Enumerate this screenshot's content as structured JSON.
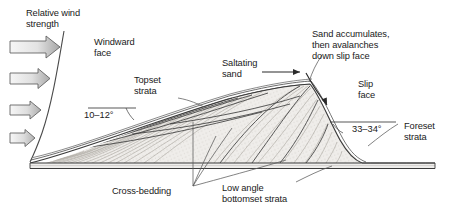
{
  "figure": {
    "type": "geological-cross-section-diagram",
    "background_color": "#ffffff",
    "outline_color": "#3a3a3a",
    "sand_fill_color": "#eceae6",
    "text_color": "#1a1a1a"
  },
  "labels": {
    "relative_wind_strength": "Relative wind\nstrength",
    "windward_face": "Windward\nface",
    "topset_strata": "Topset\nstrata",
    "saltating_sand": "Saltating\nsand",
    "sand_accumulates": "Sand accumulates,\nthen avalanches\ndown slip face",
    "slip_face": "Slip\nface",
    "foreset_strata": "Foreset\nstrata",
    "cross_bedding": "Cross-bedding",
    "bottomset_strata": "Low angle\nbottomset strata",
    "angle_windward": "10–12°",
    "angle_slipface": "33–34°"
  },
  "wind_arrows": [
    {
      "name": "wind-arrow-1",
      "strength": "strongest",
      "length": 48
    },
    {
      "name": "wind-arrow-2",
      "strength": "strong",
      "length": 38
    },
    {
      "name": "wind-arrow-3",
      "strength": "moderate",
      "length": 30
    },
    {
      "name": "wind-arrow-4",
      "strength": "weak",
      "length": 24
    }
  ],
  "icons": {
    "wind_arrow": "right-arrow-icon",
    "saltation_arrow": "right-arrow-icon",
    "avalanche_arrow": "curved-down-arrow-icon"
  },
  "colors": {
    "arrow_fill_light": "#f4f4f4",
    "arrow_fill_dark": "#a8a8a8",
    "arrow_stroke": "#5a5a5a",
    "stipple": "#b9b5ae",
    "bedding_line": "#4a4a4a",
    "leader_line": "#6e6e6e"
  }
}
